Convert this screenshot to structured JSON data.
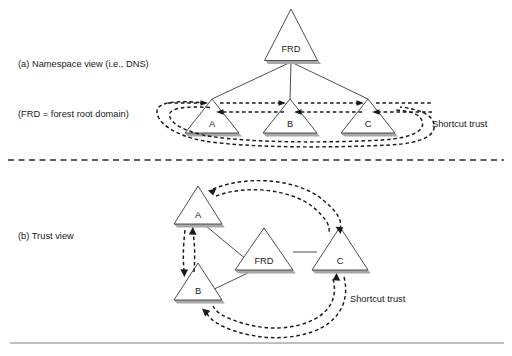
{
  "figure": {
    "title_a": "(a) Namespace view (i.e., DNS)",
    "note_a": "(FRD = forest root domain)",
    "title_b": "(b) Trust view",
    "shortcut_trust_top": "Shortcut trust",
    "shortcut_trust_bottom": "Shortcut trust"
  },
  "colors": {
    "stroke": "#3a3a3a",
    "dashed": "#1a1a1a",
    "shadow": "#a8a8a8",
    "divider": "#2b2b2b",
    "baseline": "#808080",
    "text": "#1a1a1a",
    "background": "#ffffff"
  },
  "namespace_view": {
    "root": {
      "label": "FRD",
      "apex_x": 291,
      "apex_y": 9,
      "base_y": 60,
      "half_width": 27
    },
    "children": [
      {
        "label": "A",
        "apex_x": 212,
        "apex_y": 98,
        "base_y": 133,
        "half_width": 27
      },
      {
        "label": "B",
        "apex_x": 290,
        "apex_y": 98,
        "base_y": 133,
        "half_width": 27
      },
      {
        "label": "C",
        "apex_x": 368,
        "apex_y": 98,
        "base_y": 133,
        "half_width": 27
      }
    ],
    "trusts": [
      {
        "from": "A",
        "to": "B",
        "direction": "right"
      },
      {
        "from": "B",
        "to": "A",
        "direction": "left"
      },
      {
        "from": "B",
        "to": "C",
        "direction": "right"
      },
      {
        "from": "C",
        "to": "B",
        "direction": "left"
      },
      {
        "from": "C",
        "to": "A",
        "direction": "wrap-around"
      },
      {
        "from": "A",
        "to": "C",
        "direction": "wrap-around"
      }
    ]
  },
  "trust_view": {
    "nodes": [
      {
        "label": "A",
        "apex_x": 198,
        "apex_y": 186,
        "base_y": 224,
        "half_width": 24
      },
      {
        "label": "B",
        "apex_x": 198,
        "apex_y": 263,
        "base_y": 300,
        "half_width": 24
      },
      {
        "label": "FRD",
        "apex_x": 264,
        "apex_y": 228,
        "base_y": 270,
        "half_width": 29
      },
      {
        "label": "C",
        "apex_x": 340,
        "apex_y": 227,
        "base_y": 270,
        "half_width": 28
      }
    ],
    "tree_links": [
      {
        "from": "FRD",
        "to": "A"
      },
      {
        "from": "FRD",
        "to": "B"
      },
      {
        "from": "FRD",
        "to": "C"
      }
    ],
    "trusts": [
      {
        "from": "A",
        "to": "B",
        "direction": "down"
      },
      {
        "from": "B",
        "to": "A",
        "direction": "up"
      },
      {
        "from": "A",
        "to": "C",
        "direction": "clockwise"
      },
      {
        "from": "C",
        "to": "B",
        "direction": "counter-clockwise"
      }
    ]
  },
  "divider": {
    "y": 160,
    "x1": 8,
    "x2": 504,
    "style": "dashed"
  },
  "baseline": {
    "y": 343,
    "x1": 10,
    "x2": 504,
    "style": "solid"
  }
}
